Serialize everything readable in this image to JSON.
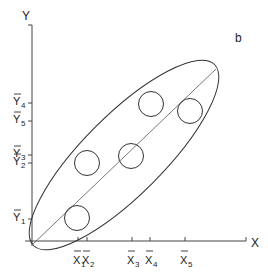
{
  "figure": {
    "panel_label": "b",
    "axes": {
      "x_label": "X",
      "y_label": "Y"
    },
    "x_ticks": [
      {
        "name": "X",
        "sub": "1",
        "pos": 78
      },
      {
        "name": "X",
        "sub": "2",
        "pos": 87
      },
      {
        "name": "X",
        "sub": "3",
        "pos": 132
      },
      {
        "name": "X",
        "sub": "4",
        "pos": 150
      },
      {
        "name": "X",
        "sub": "5",
        "pos": 185
      }
    ],
    "y_ticks": [
      {
        "name": "Y",
        "sub": "4",
        "pos": 103
      },
      {
        "name": "Y",
        "sub": "5",
        "pos": 121
      },
      {
        "name": "Y",
        "sub": "3",
        "pos": 155
      },
      {
        "name": "Y",
        "sub": "2",
        "pos": 163
      },
      {
        "name": "Y",
        "sub": "1",
        "pos": 219
      }
    ],
    "circles": [
      {
        "id": 1,
        "cx": 77,
        "cy": 218,
        "r": 12.5
      },
      {
        "id": 2,
        "cx": 87,
        "cy": 163,
        "r": 12.5
      },
      {
        "id": 3,
        "cx": 131,
        "cy": 156,
        "r": 12.5
      },
      {
        "id": 4,
        "cx": 151,
        "cy": 104,
        "r": 12.5
      },
      {
        "id": 5,
        "cx": 190,
        "cy": 111,
        "r": 12.5
      }
    ],
    "regression_line": {
      "x1": 32,
      "y1": 245,
      "x2": 216,
      "y2": 69
    },
    "ellipse": {
      "cx": 124,
      "cy": 155,
      "rx": 128,
      "ry": 40,
      "rotate": -45
    }
  }
}
